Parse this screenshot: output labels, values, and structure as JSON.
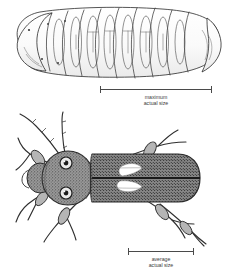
{
  "plate": {
    "name": "beetle-life-stages-plate",
    "background_color": "#ffffff",
    "ink_color": "#2b2b2b"
  },
  "figures": [
    {
      "id": "larva",
      "label": "beetle larva lateral view",
      "description": "Segmented grub-like larva shown in side view with ten body segments, outlined in fine black line with pale grey shading",
      "segment_count": 10,
      "orientation": "lateral",
      "fill_color": "#fbfbfb",
      "outline_color": "#2b2b2b"
    },
    {
      "id": "beetle",
      "label": "adult beetle dorsal view",
      "description": "Adult beetle viewed from above with two large round eyes, stippled pronotum, dark elytra bearing two pale teardrop markings, six legs and two long segmented antennae",
      "eye_count": 2,
      "leg_count": 6,
      "antenna_count": 2,
      "elytra_spot_count": 2,
      "orientation": "dorsal",
      "body_color": "#8d8d8d",
      "spot_color": "#ffffff",
      "outline_color": "#2b2b2b"
    }
  ],
  "scale_bars": [
    {
      "id": "maximum",
      "caption_line_1": "maximum",
      "caption_line_2": "actual size",
      "applies_to": "larva",
      "rule_color": "#4a4a4a"
    },
    {
      "id": "average",
      "caption_line_1": "average",
      "caption_line_2": "actual size",
      "applies_to": "beetle",
      "rule_color": "#4a4a4a"
    }
  ]
}
